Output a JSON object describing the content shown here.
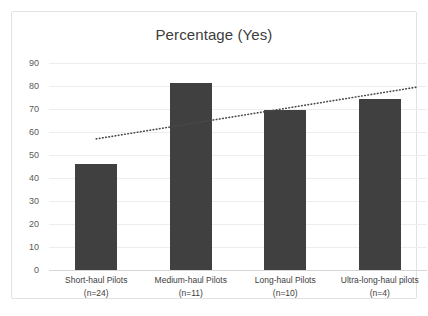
{
  "chart_data": {
    "type": "bar",
    "title": "Percentage (Yes)",
    "xlabel": "",
    "ylabel": "",
    "ylim": [
      0,
      90
    ],
    "ytick_step": 10,
    "yticks": [
      90,
      80,
      70,
      60,
      50,
      40,
      30,
      20,
      10,
      0
    ],
    "grid": true,
    "legend": false,
    "legend_position": "none",
    "categories": [
      "Short-haul Pilots (n=24)",
      "Medium-haul Pilots (n=11)",
      "Long-haul Pilots (n=10)",
      "Ultra-long-haul pilots (n=4)"
    ],
    "category_lines": [
      {
        "line1": "Short-haul Pilots",
        "line2": "(n=24)"
      },
      {
        "line1": "Medium-haul Pilots",
        "line2": "(n=11)"
      },
      {
        "line1": "Long-haul Pilots",
        "line2": "(n=10)"
      },
      {
        "line1": "Ultra-long-haul pilots",
        "line2": "(n=4)"
      }
    ],
    "values": [
      46,
      81.5,
      69.5,
      74.5
    ],
    "series": [
      {
        "name": "Percentage (Yes)",
        "values": [
          46,
          81.5,
          69.5,
          74.5
        ],
        "color": "#404040"
      }
    ],
    "trendline": {
      "type": "linear",
      "style": "dotted",
      "color": "#4a4a4a",
      "start_value": 57,
      "end_value": 79.5
    },
    "colors": {
      "bar": "#404040",
      "gridline": "#ededed",
      "axis": "#d6d6d6",
      "title_text": "#3d3d3d",
      "tick_text": "#595959",
      "frame_border": "#e2e2e2",
      "background": "#ffffff"
    }
  },
  "caption": {
    "text": ""
  }
}
